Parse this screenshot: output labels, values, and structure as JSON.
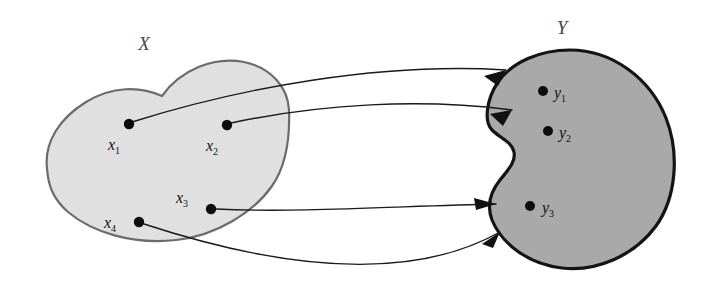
{
  "figure": {
    "type": "set-mapping-diagram",
    "background_color": "#ffffff"
  },
  "sets": {
    "domain": {
      "label": "X",
      "label_x": 144,
      "label_y": 50,
      "fill_color": "#e0e0e0",
      "stroke_color": "#6b6b6b",
      "stroke_width": 2.2
    },
    "codomain": {
      "label": "Y",
      "label_x": 562,
      "label_y": 34,
      "fill_color": "#a9a9a9",
      "stroke_color": "#141414",
      "stroke_width": 3.2
    }
  },
  "domain_points": [
    {
      "name": "x1",
      "base": "x",
      "sub": "1",
      "cx": 129,
      "cy": 124,
      "label_x": 108,
      "label_y": 150,
      "r": 5.2
    },
    {
      "name": "x2",
      "base": "x",
      "sub": "2",
      "cx": 227,
      "cy": 125,
      "label_x": 206,
      "label_y": 151,
      "r": 5.2
    },
    {
      "name": "x3",
      "base": "x",
      "sub": "3",
      "cx": 211,
      "cy": 209,
      "label_x": 176,
      "label_y": 203,
      "r": 5.2
    },
    {
      "name": "x4",
      "base": "x",
      "sub": "4",
      "cx": 139,
      "cy": 222,
      "label_x": 104,
      "label_y": 228,
      "r": 5.2
    }
  ],
  "codomain_points": [
    {
      "name": "y1",
      "base": "y",
      "sub": "1",
      "cx": 543,
      "cy": 91,
      "label_x": 554,
      "label_y": 98,
      "r": 5.0
    },
    {
      "name": "y2",
      "base": "y",
      "sub": "2",
      "cx": 548,
      "cy": 131,
      "label_x": 559,
      "label_y": 138,
      "r": 5.0
    },
    {
      "name": "y3",
      "base": "y",
      "sub": "3",
      "cx": 530,
      "cy": 206,
      "label_x": 542,
      "label_y": 213,
      "r": 5.0
    }
  ],
  "arrows": [
    {
      "name": "map-x1-to-y1",
      "from": "x1",
      "to": "y1",
      "path": "M 132 122 C 240 88 380 62 506 70",
      "stroke": "#1a1a1a",
      "stroke_width": 1.4
    },
    {
      "name": "map-x2-to-y2",
      "from": "x2",
      "to": "y2",
      "path": "M 231 123 C 320 104 420 98 512 110",
      "stroke": "#1a1a1a",
      "stroke_width": 1.4
    },
    {
      "name": "map-x3-to-y3",
      "from": "x3",
      "to": "y3",
      "path": "M 216 209 C 300 213 400 206 496 204",
      "stroke": "#1a1a1a",
      "stroke_width": 1.4
    },
    {
      "name": "map-x4-to-y3",
      "from": "x4",
      "to": "y3",
      "path": "M 144 224 C 260 262 400 288 500 232",
      "stroke": "#1a1a1a",
      "stroke_width": 1.4
    }
  ],
  "arrowheads": [
    {
      "name": "arrowhead-y1",
      "points": "506,70 484,76 498,86",
      "angle": "down-right"
    },
    {
      "name": "arrowhead-y2",
      "points": "512,110 490,114 503,126",
      "angle": "down-right"
    },
    {
      "name": "arrowhead-y3-from-x3",
      "points": "496,204 474,198 476,210",
      "angle": "right"
    },
    {
      "name": "arrowhead-y3-from-x4",
      "points": "500,232 482,244 493,248",
      "angle": "up-right"
    }
  ],
  "shapes": {
    "domain_path": "M 47 168 C 44 142 60 118 86 102 C 112 86 140 86 162 96 C 180 70 214 56 244 62 C 272 68 288 88 289 110 C 290 138 286 166 272 186 C 254 212 216 236 176 240 C 132 245 92 232 68 212 C 52 198 48 184 47 168 Z",
    "codomain_path": "M 498 82 C 512 62 540 50 570 50 C 612 50 650 78 666 118 C 680 154 676 198 656 226 C 634 256 596 272 562 268 C 528 264 502 244 492 220 C 486 204 492 190 500 180 C 508 170 516 162 514 152 C 512 142 500 138 492 130 C 484 122 486 100 498 82 Z"
  }
}
